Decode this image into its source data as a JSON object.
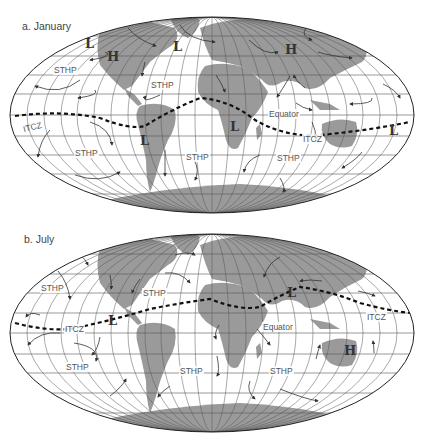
{
  "figure": {
    "panels": [
      {
        "id": "a",
        "title": "a.  January",
        "labels": {
          "sthp_1": "STHP",
          "sthp_2": "STHP",
          "sthp_3": "STHP",
          "sthp_4": "STHP",
          "sthp_5": "STHP",
          "equator": "Equator",
          "itcz_1": "ITCZ",
          "itcz_2": "ITCZ"
        },
        "symbols": {
          "low_1": "L",
          "low_2": "L",
          "low_3": "L",
          "low_4": "L",
          "low_5": "L",
          "high_1": "H",
          "high_2": "H"
        }
      },
      {
        "id": "b",
        "title": "b.  July",
        "labels": {
          "sthp_1": "STHP",
          "sthp_2": "STHP",
          "sthp_3": "STHP",
          "sthp_4": "STHP",
          "sthp_5": "STHP",
          "sthp_6": "STHP",
          "equator": "Equator",
          "itcz_1": "ITCZ",
          "itcz_2": "ITCZ"
        },
        "symbols": {
          "low_1": "L",
          "low_2": "L",
          "high_1": "H"
        }
      }
    ],
    "legend_terms": {
      "STHP": "Subtropical High Pressure",
      "ITCZ": "Intertropical Convergence Zone",
      "L": "Low pressure",
      "H": "High pressure"
    },
    "colors": {
      "land": "#9a9a9a",
      "grid": "#555555",
      "outline": "#222222",
      "itcz_line": "#111111",
      "arrow": "#333333"
    }
  }
}
